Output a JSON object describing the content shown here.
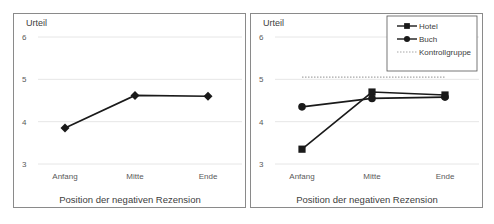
{
  "chart_data": [
    {
      "type": "line",
      "title": "",
      "ylabel": "Urteil",
      "xlabel": "Position der negativen Rezension",
      "categories": [
        "Anfang",
        "Mitte",
        "Ende"
      ],
      "yticks": [
        3,
        4,
        5,
        6
      ],
      "ylim": [
        3,
        6
      ],
      "grid": true,
      "series": [
        {
          "name": "Gesamt",
          "marker": "diamond",
          "values": [
            3.85,
            4.62,
            4.6
          ]
        }
      ],
      "legend": null
    },
    {
      "type": "line",
      "title": "",
      "ylabel": "Urteil",
      "xlabel": "Position der negativen Rezension",
      "categories": [
        "Anfang",
        "Mitte",
        "Ende"
      ],
      "yticks": [
        3,
        4,
        5,
        6
      ],
      "ylim": [
        3,
        6
      ],
      "grid": true,
      "series": [
        {
          "name": "Hotel",
          "marker": "square",
          "values": [
            3.35,
            4.7,
            4.63
          ]
        },
        {
          "name": "Buch",
          "marker": "circle",
          "values": [
            4.35,
            4.55,
            4.58
          ]
        },
        {
          "name": "Kontrollgruppe",
          "marker": "none",
          "style": "dotted",
          "values": [
            5.05,
            5.05,
            5.05
          ]
        }
      ],
      "legend": {
        "position": "top-right",
        "entries": [
          "Hotel",
          "Buch",
          "Kontrollgruppe"
        ]
      }
    }
  ],
  "colors": {
    "line": "#1a1a1a",
    "grid": "#e6e6e6",
    "control": "#a6a6a6",
    "border": "#8a8a8a"
  }
}
